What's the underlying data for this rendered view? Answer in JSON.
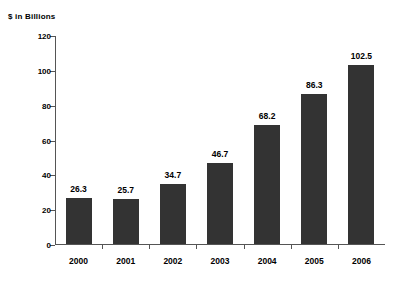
{
  "chart_data": {
    "type": "bar",
    "title": "$ in Billions",
    "xlabel": "",
    "ylabel": "",
    "categories": [
      "2000",
      "2001",
      "2002",
      "2003",
      "2004",
      "2005",
      "2006"
    ],
    "values": [
      26.3,
      25.7,
      34.7,
      46.7,
      68.2,
      86.3,
      102.5
    ],
    "value_labels": [
      "26.3",
      "25.7",
      "34.7",
      "46.7",
      "68.2",
      "86.3",
      "102.5"
    ],
    "ylim": [
      0,
      120
    ],
    "yticks": [
      0,
      20,
      40,
      60,
      80,
      100,
      120
    ],
    "ytick_labels": [
      "0",
      "20",
      "40",
      "60",
      "80",
      "100",
      "120"
    ],
    "grid": false,
    "legend": null,
    "bar_color": "#333333",
    "axis_color": "#555555",
    "background_color": "#ffffff",
    "text_color": "#000000"
  }
}
